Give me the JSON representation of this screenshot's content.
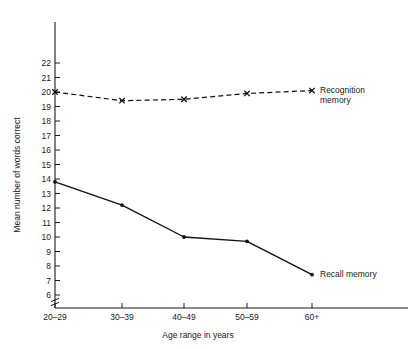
{
  "chart_data": {
    "type": "line",
    "title": "",
    "xlabel": "Age range in years",
    "ylabel": "Mean number of words correct",
    "categories": [
      "20–29",
      "30–39",
      "40–49",
      "50–59",
      "60+"
    ],
    "ylim": [
      6,
      22
    ],
    "yticks": [
      6,
      7,
      8,
      9,
      10,
      11,
      12,
      13,
      14,
      15,
      16,
      17,
      18,
      19,
      20,
      21,
      22
    ],
    "ytick_labels": [
      "6",
      "7",
      "8",
      "9",
      "10",
      "11",
      "12",
      "13",
      "14",
      "15",
      "16",
      "17",
      "18",
      "19",
      "20",
      "21",
      "22"
    ],
    "y_axis_break": true,
    "grid": false,
    "legend_position": "inline-right",
    "series": [
      {
        "name": "Recognition memory",
        "label_line1": "Recognition",
        "label_line2": "memory",
        "values": [
          20.0,
          19.4,
          19.5,
          19.9,
          20.1
        ],
        "linestyle": "dashed",
        "marker": "cross",
        "color": "#111111"
      },
      {
        "name": "Recall memory",
        "label_line1": "Recall memory",
        "label_line2": "",
        "values": [
          13.8,
          12.2,
          10.0,
          9.7,
          7.4
        ],
        "linestyle": "solid",
        "marker": "dot",
        "color": "#111111"
      }
    ]
  }
}
